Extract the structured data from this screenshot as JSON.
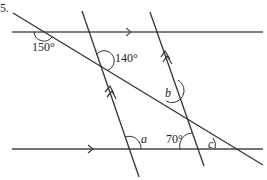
{
  "question_number": "5.",
  "angles": {
    "top_left": "150°",
    "upper_intersection": "140°",
    "b": "b",
    "a": "a",
    "seventy": "70°",
    "c": "c"
  },
  "colors": {
    "line": "#333333",
    "parallel_line": "#555555",
    "text": "#222222",
    "background": "#ffffff"
  }
}
